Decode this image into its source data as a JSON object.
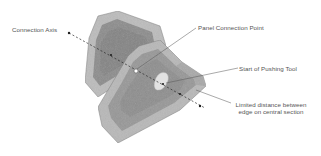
{
  "diagram": {
    "labels": {
      "connection_axis": "Connection Axis",
      "panel_connection_point": "Panel Connection Point",
      "start_of_pushing_tool": "Start of Pushing Tool",
      "limited_distance_line1": "Limited distance between",
      "limited_distance_line2": "edge on central section"
    },
    "colors": {
      "outer_panel": "#b9b9b9",
      "inner_panel": "#8e8e8e",
      "inner_panel_front": "#979797",
      "edge": "#6f6f6f",
      "leader_line": "#555555",
      "dot": "#1e1e1e",
      "connection_point": "#ffffff",
      "pushing_tool_area": "#e2e2e2"
    }
  }
}
